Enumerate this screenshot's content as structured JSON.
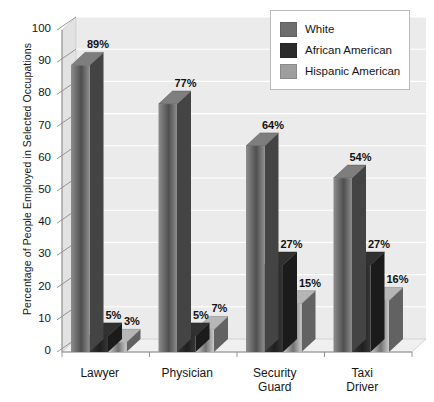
{
  "chart_data": {
    "type": "bar",
    "title": "",
    "subtitle": "",
    "xlabel": "",
    "ylabel": "Percentage of People Employed in Selected Occupations",
    "ylim": [
      0,
      100
    ],
    "ytick_step": 10,
    "yticks": [
      "100",
      "90",
      "80",
      "70",
      "60",
      "50",
      "40",
      "30",
      "20",
      "10",
      "0"
    ],
    "grid": true,
    "grid_axis": "y",
    "legend_position": "top-right",
    "style": "3d-grouped-columns",
    "categories": [
      "Lawyer",
      "Physician",
      "Security Guard",
      "Taxi Driver"
    ],
    "category_lines": [
      [
        "Lawyer"
      ],
      [
        "Physician"
      ],
      [
        "Security",
        "Guard"
      ],
      [
        "Taxi",
        "Driver"
      ]
    ],
    "series": [
      {
        "name": "White",
        "color": "#6e6e6e",
        "values": [
          89,
          77,
          64,
          54
        ],
        "labels": [
          "89%",
          "77%",
          "64%",
          "54%"
        ]
      },
      {
        "name": "African American",
        "color": "#2b2b2b",
        "values": [
          5,
          5,
          27,
          27
        ],
        "labels": [
          "5%",
          "5%",
          "27%",
          "27%"
        ]
      },
      {
        "name": "Hispanic American",
        "color": "#9e9e9e",
        "values": [
          3,
          7,
          15,
          16
        ],
        "labels": [
          "3%",
          "7%",
          "15%",
          "16%"
        ]
      }
    ]
  },
  "legend": {
    "items": [
      {
        "label": "White",
        "swatch": "#6e6e6e"
      },
      {
        "label": "African American",
        "swatch": "#2b2b2b"
      },
      {
        "label": "Hispanic American",
        "swatch": "#9e9e9e"
      }
    ]
  },
  "colors": {
    "plot_background": "#ebebeb",
    "wall_side": "#e2e2e2",
    "floor": "#f0f0f0",
    "gridline": "#ffffff",
    "axis_line": "#8a8a8a",
    "text": "#151515"
  }
}
